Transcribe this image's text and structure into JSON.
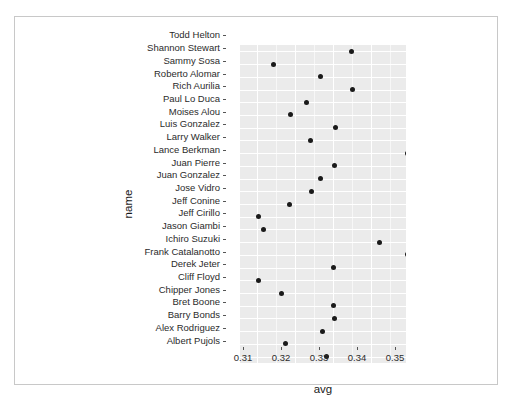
{
  "chart_data": {
    "type": "scatter",
    "title": "",
    "xlabel": "avg",
    "ylabel": "name",
    "xlim": [
      0.3055,
      0.3492
    ],
    "xticks": [
      0.31,
      0.32,
      0.33,
      0.34,
      0.35
    ],
    "xtick_labels": [
      "0.31",
      "0.32",
      "0.33",
      "0.34",
      "0.35"
    ],
    "grid": true,
    "legend": null,
    "categories": [
      "Todd Helton",
      "Shannon Stewart",
      "Sammy Sosa",
      "Roberto Alomar",
      "Rich Aurilia",
      "Paul Lo Duca",
      "Moises Alou",
      "Luis Gonzalez",
      "Larry Walker",
      "Lance Berkman",
      "Juan Pierre",
      "Juan Gonzalez",
      "Jose Vidro",
      "Jeff Conine",
      "Jeff Cirillo",
      "Jason Giambi",
      "Ichiro Suzuki",
      "Frank Catalanotto",
      "Derek Jeter",
      "Cliff Floyd",
      "Chipper Jones",
      "Bret Boone",
      "Barry Bonds",
      "Alex Rodriguez",
      "Albert Pujols"
    ],
    "values": [
      0.3348,
      0.3144,
      0.3267,
      0.335,
      0.323,
      0.3188,
      0.3307,
      0.324,
      0.3495,
      0.3304,
      0.3267,
      0.3244,
      0.3184,
      0.3103,
      0.3116,
      0.3421,
      0.3495,
      0.33,
      0.3103,
      0.3165,
      0.33,
      0.3304,
      0.3272,
      0.3176,
      0.3283
    ],
    "point_color": "#1a1a1a",
    "panel_color": "#ebebeb",
    "grid_color": "#ffffff"
  }
}
